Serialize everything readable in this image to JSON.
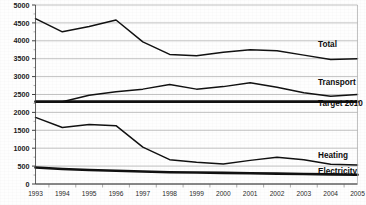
{
  "chart_data": {
    "type": "line",
    "title": "",
    "subtitle": "",
    "xlabel": "",
    "ylabel": "",
    "grid": "horizontal",
    "legend_position": "inline-right-end-labels",
    "categories": [
      "1993",
      "1994",
      "1995",
      "1996",
      "1997",
      "1998",
      "1999",
      "2000",
      "2001",
      "2002",
      "2003",
      "2004",
      "2005"
    ],
    "x": [
      1993,
      1994,
      1995,
      1996,
      1997,
      1998,
      1999,
      2000,
      2001,
      2002,
      2003,
      2004,
      2005
    ],
    "ylim": [
      0,
      5000
    ],
    "ytick_labels": [
      "5000",
      "4500",
      "4000",
      "3500",
      "3000",
      "2500",
      "2000",
      "1500",
      "1000",
      "500",
      "0"
    ],
    "ytick_values": [
      5000,
      4500,
      4000,
      3500,
      3000,
      2500,
      2000,
      1500,
      1000,
      500,
      0
    ],
    "xtick_labels": [
      "1993",
      "1994",
      "1995",
      "1996",
      "1997",
      "1998",
      "1999",
      "2000",
      "2001",
      "2002",
      "2003",
      "2004",
      "2005"
    ],
    "series": [
      {
        "name": "Total",
        "label": "Total",
        "style": "normal",
        "values": [
          4620,
          4250,
          4400,
          4580,
          3970,
          3620,
          3580,
          3680,
          3750,
          3720,
          3600,
          3480,
          3500
        ]
      },
      {
        "name": "Transport",
        "label": "Transport",
        "style": "normal",
        "values": [
          2300,
          2300,
          2480,
          2580,
          2650,
          2780,
          2650,
          2720,
          2830,
          2700,
          2550,
          2450,
          2500
        ]
      },
      {
        "name": "Target 2010",
        "label": "Target 2010",
        "style": "thick",
        "values": [
          2300,
          2300,
          2300,
          2300,
          2300,
          2300,
          2300,
          2300,
          2300,
          2300,
          2300,
          2300,
          2300
        ]
      },
      {
        "name": "Heating",
        "label": "Heating",
        "style": "normal",
        "values": [
          1860,
          1580,
          1660,
          1630,
          1030,
          680,
          610,
          560,
          660,
          750,
          680,
          550,
          530
        ]
      },
      {
        "name": "Electricity",
        "label": "Electricity",
        "style": "thick",
        "values": [
          460,
          420,
          390,
          370,
          350,
          330,
          320,
          310,
          300,
          290,
          280,
          270,
          260
        ]
      }
    ],
    "series_label_anchors": [
      {
        "name": "Total",
        "value": 3750
      },
      {
        "name": "Transport",
        "value": 2700
      },
      {
        "name": "Target 2010",
        "value": 2120
      },
      {
        "name": "Heating",
        "value": 660
      },
      {
        "name": "Electricity",
        "value": 220
      }
    ],
    "colors": {
      "line": "#111111",
      "grid": "#a8a8a8",
      "axis": "#3a3a3a",
      "text": "#1a1a1a",
      "background": "#fefefe"
    }
  }
}
